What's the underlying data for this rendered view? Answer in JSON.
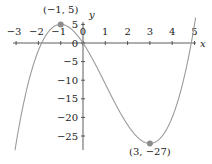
{
  "chart_data": {
    "type": "line",
    "title": "",
    "function": "f(x) = x^3 - 3x^2 - 9x",
    "xlabel": "x",
    "ylabel": "y",
    "xlim": [
      -3.1,
      5.1
    ],
    "ylim": [
      -29,
      6
    ],
    "x_ticks": [
      -3,
      -2,
      -1,
      0,
      1,
      2,
      3,
      4,
      5
    ],
    "x_tick_labels": [
      "−3",
      "−2",
      "−1",
      "0",
      "1",
      "2",
      "3",
      "4",
      "5"
    ],
    "y_ticks": [
      5,
      0,
      -5,
      -10,
      -15,
      -20,
      -25
    ],
    "y_tick_labels": [
      "5",
      "0",
      "−5",
      "−10",
      "−15",
      "−20",
      "−25"
    ],
    "grid": false,
    "legend": null,
    "series": [
      {
        "name": "f(x)",
        "x": [
          -3.05,
          -3,
          -2.5,
          -2,
          -1.5,
          -1,
          -0.5,
          0,
          0.5,
          1,
          1.5,
          2,
          2.5,
          3,
          3.5,
          4,
          4.5,
          5
        ],
        "y": [
          -28.3,
          -27,
          -12.125,
          -2,
          3.375,
          5,
          3.625,
          0,
          -5.125,
          -11,
          -16.875,
          -22,
          -25.625,
          -27,
          -25.375,
          -20,
          -10.125,
          5
        ]
      }
    ],
    "annotations": [
      {
        "label": "(−1, 5)",
        "x": -1,
        "y": 5,
        "kind": "local maximum"
      },
      {
        "label": "(3, −27)",
        "x": 3,
        "y": -27,
        "kind": "local minimum"
      }
    ]
  },
  "labels": {
    "x_axis": "x",
    "y_axis": "y",
    "origin_y_label": "0",
    "max_point": "(−1, 5)",
    "min_point": "(3, −27)"
  },
  "colors": {
    "curve": "#9a9a9a",
    "axis": "#333333",
    "point": "#8c8c8c",
    "text": "#222222"
  }
}
